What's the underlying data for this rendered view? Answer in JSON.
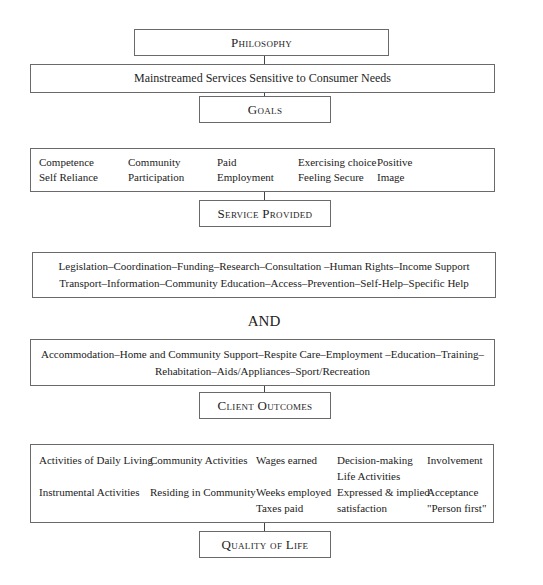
{
  "philosophy": {
    "title": "Philosophy"
  },
  "philosophy_statement": "Mainstreamed Services Sensitive to Consumer Needs",
  "goals": {
    "title": "Goals",
    "items": [
      [
        "Competence",
        "Self Reliance"
      ],
      [
        "Community",
        "Participation"
      ],
      [
        "Paid",
        "Employment"
      ],
      [
        "Exercising choice",
        "Feeling Secure"
      ],
      [
        "Positive",
        "Image"
      ]
    ]
  },
  "service_provided": {
    "title": "Service Provided",
    "generic_services": {
      "line1": "Legislation–Coordination–Funding–Research–Consultation –Human Rights–Income Support",
      "line2": "Transport–Information–Community Education–Access–Prevention–Self-Help–Specific Help"
    },
    "connector": "AND",
    "specific_services": {
      "line1": "Accommodation–Home and Community Support–Respite Care–Employment –Education–Training–",
      "line2": "Rehabitation–Aids/Appliances–Sport/Recreation"
    }
  },
  "client_outcomes": {
    "title": "Client Outcomes",
    "columns": [
      {
        "row1": [
          "Activities of Daily Living"
        ],
        "row2": [
          "Instrumental Activities"
        ]
      },
      {
        "row1": [
          "Community Activities"
        ],
        "row2": [
          "Residing in Community"
        ]
      },
      {
        "row1": [
          "Wages earned"
        ],
        "row2": [
          "Weeks employed",
          "Taxes paid"
        ]
      },
      {
        "row1": [
          "Decision-making",
          "Life Activities"
        ],
        "row2": [
          "Expressed & implied",
          "satisfaction"
        ]
      },
      {
        "row1": [
          "Involvement"
        ],
        "row2": [
          "Acceptance",
          "\"Person first\""
        ]
      }
    ]
  },
  "quality_of_life": {
    "title": "Quality of Life"
  }
}
